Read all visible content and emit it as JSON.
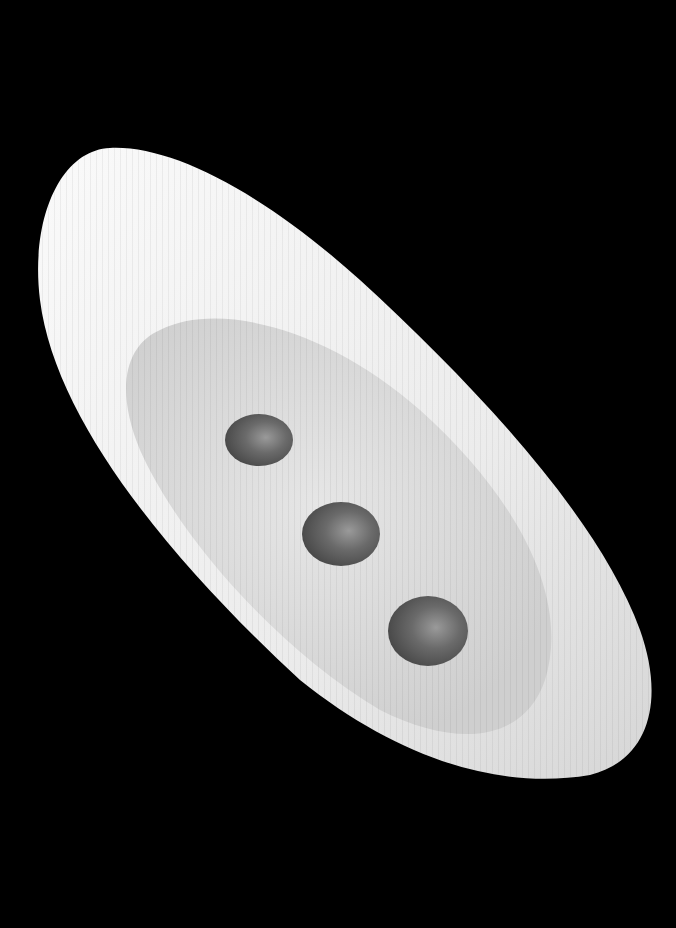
{
  "scene": {
    "description": "White oval porcelain dish with three brown sauce drops on black background",
    "background_color": "#000000",
    "dish_color": "#f2f2f2",
    "well_color": "#dcdcdc",
    "drop_color": "#6e6e6e",
    "drops": [
      {
        "cx": 259,
        "cy": 440,
        "rx": 34,
        "ry": 26
      },
      {
        "cx": 341,
        "cy": 534,
        "rx": 39,
        "ry": 32
      },
      {
        "cx": 428,
        "cy": 631,
        "rx": 40,
        "ry": 35
      }
    ]
  }
}
